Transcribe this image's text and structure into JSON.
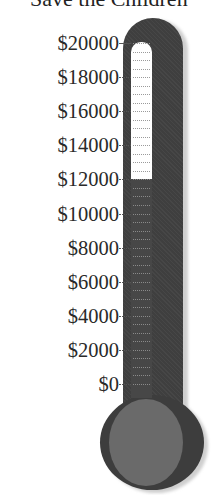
{
  "title": "Save the Children",
  "chart_data": {
    "type": "thermometer",
    "title": "Save the Children",
    "unit": "$",
    "goal": 20000,
    "current": 12000,
    "ylim": [
      0,
      20000
    ],
    "ticks": [
      0,
      2000,
      4000,
      6000,
      8000,
      10000,
      12000,
      14000,
      16000,
      18000,
      20000
    ],
    "tick_labels": [
      "$0",
      "$2000",
      "$4000",
      "$6000",
      "$8000",
      "$10000",
      "$12000",
      "$14000",
      "$16000",
      "$18000",
      "$20000"
    ],
    "grid": true,
    "colors": {
      "tube": "#3f3f3f",
      "fill": "#474747",
      "empty": "#ffffff",
      "bulb_outer": "#3d3d3d",
      "bulb_inner": "#6a6a6a"
    }
  },
  "labels": [
    {
      "text": "$20000",
      "value": 20000
    },
    {
      "text": "$18000",
      "value": 18000
    },
    {
      "text": "$16000",
      "value": 16000
    },
    {
      "text": "$14000",
      "value": 14000
    },
    {
      "text": "$12000",
      "value": 12000
    },
    {
      "text": "$10000",
      "value": 10000
    },
    {
      "text": "$8000",
      "value": 8000
    },
    {
      "text": "$6000",
      "value": 6000
    },
    {
      "text": "$4000",
      "value": 4000
    },
    {
      "text": "$2000",
      "value": 2000
    },
    {
      "text": "$0",
      "value": 0
    }
  ]
}
